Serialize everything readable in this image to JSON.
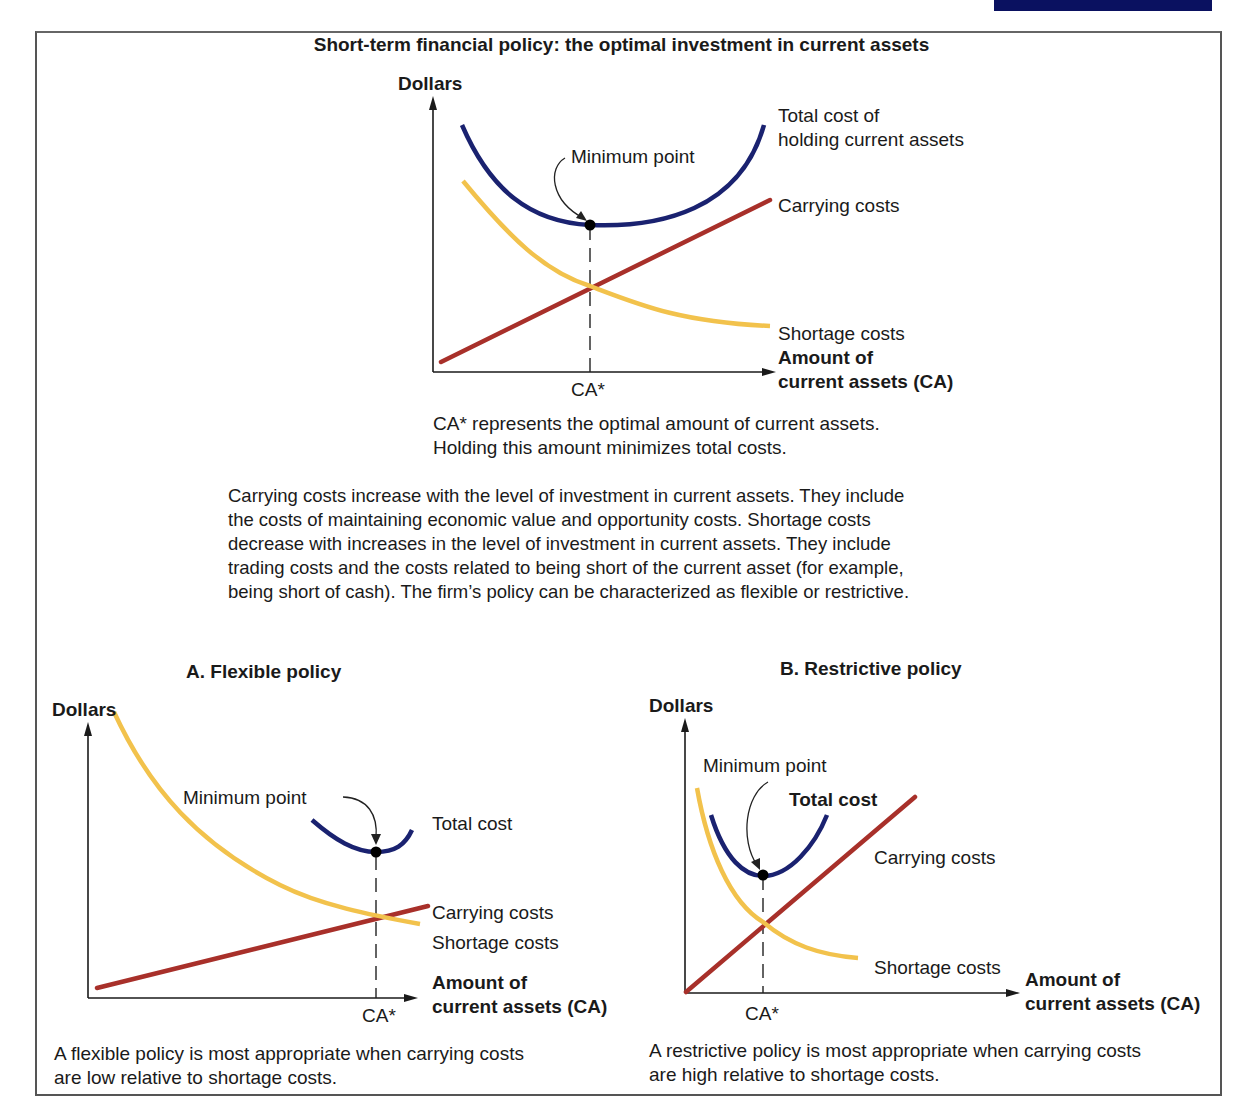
{
  "page": {
    "header_fragment": "...ing ... g",
    "title": "Short-term financial policy: the optimal investment in current assets"
  },
  "colors": {
    "total_cost": "#1a2270",
    "carrying_costs": "#a8302a",
    "shortage_costs": "#f2c24c",
    "axis": "#1a1a1a",
    "frame": "#555555",
    "header_block": "#0a1160"
  },
  "main_chart": {
    "y_axis_label": "Dollars",
    "x_axis_label_line1": "Amount of",
    "x_axis_label_line2": "current assets (CA)",
    "x_tick": "CA*",
    "annotation": "Minimum point",
    "legend_total_line1": "Total cost of",
    "legend_total_line2": "holding current assets",
    "legend_carrying": "Carrying costs",
    "legend_shortage": "Shortage costs",
    "caption_line1": "CA* represents the optimal amount of current assets.",
    "caption_line2": "Holding this amount minimizes total costs."
  },
  "description": {
    "line1": "Carrying costs increase with the level of investment in current assets. They include",
    "line2": "the costs of maintaining economic value and opportunity costs. Shortage costs",
    "line3": "decrease with increases in the level of investment in current assets. They include",
    "line4": "trading costs and the costs related to being short of the current asset (for example,",
    "line5": "being short of cash). The firm’s policy can be characterized as flexible or restrictive."
  },
  "panel_a": {
    "title": "A. Flexible policy",
    "y_axis_label": "Dollars",
    "x_axis_label_line1": "Amount of",
    "x_axis_label_line2": "current assets (CA)",
    "x_tick": "CA*",
    "annotation": "Minimum point",
    "legend_total": "Total cost",
    "legend_carrying": "Carrying costs",
    "legend_shortage": "Shortage costs",
    "caption_line1": "A flexible policy is most appropriate when carrying costs",
    "caption_line2": "are low relative to shortage costs."
  },
  "panel_b": {
    "title": "B. Restrictive policy",
    "y_axis_label": "Dollars",
    "x_axis_label_line1": "Amount of",
    "x_axis_label_line2": "current assets (CA)",
    "x_tick": "CA*",
    "annotation": "Minimum point",
    "legend_total": "Total cost",
    "legend_carrying": "Carrying costs",
    "legend_shortage": "Shortage costs",
    "caption_line1": "A restrictive policy is most appropriate when carrying costs",
    "caption_line2": "are high relative to shortage costs."
  }
}
